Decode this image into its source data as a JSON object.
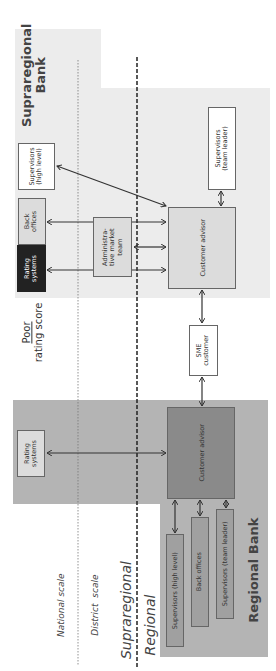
{
  "diagram": {
    "orientation": "rotated 90 degrees counter-clockwise",
    "center_label": {
      "line1": "Poor",
      "line2": "rating score"
    },
    "scales": {
      "national": "National scale",
      "district": "District  scale",
      "supraregional": "Supraregional",
      "regional": "Regional"
    },
    "supraregional_bank": {
      "title_line1": "Supraregional",
      "title_line2": "Bank",
      "nodes": {
        "supervisors_high": "Supervisors\n(high level)",
        "back_offices": "Back\noffices",
        "rating_systems": "Rating\nsystems",
        "admin_market_team": "Administra-\ntive market\nteam",
        "customer_advisor": "Customer advisor",
        "supervisors_team_leader": "Supervisors\n(team leader)"
      }
    },
    "sme_customer": "SME\ncustomer",
    "regional_bank": {
      "title": "Regional Bank",
      "nodes": {
        "rating_systems": "Rating\nsystems",
        "customer_advisor": "Customer advisor",
        "supervisors_high": "Supervisors (high level)",
        "back_offices": "Back offices",
        "supervisors_team_leader": "Supervisors (team leader)"
      }
    },
    "colors": {
      "supraregional_region": "#ececec",
      "regional_region": "#b4b4b4",
      "regional_advisor": "#8a8a8a",
      "rating_systems_supra": "#222222",
      "line": "#333333"
    }
  }
}
